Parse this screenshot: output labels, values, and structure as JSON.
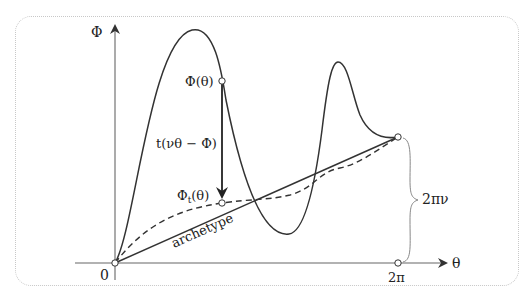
{
  "diagram": {
    "axes": {
      "y_label": "Φ",
      "x_label": "θ",
      "origin_label": "0",
      "x_end_label": "2π"
    },
    "labels": {
      "phi_theta": "Φ(θ)",
      "phi_t_base": "Φ",
      "phi_t_sub": "t",
      "phi_t_arg": "(θ)",
      "correction": "t(νθ − Φ)",
      "archetype": "archetype",
      "brace": "2πν"
    },
    "colors": {
      "curve": "#333333",
      "axis": "#666666",
      "frame": "#c8c8c8",
      "brace": "#888888"
    }
  }
}
